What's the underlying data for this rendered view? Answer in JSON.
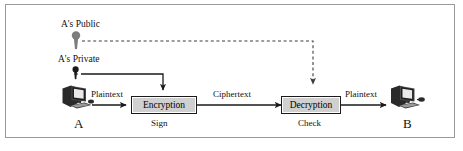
{
  "figure": {
    "frame_color": "#9a9a9a",
    "background": "#ffffff",
    "line_color": "#1a1a1a",
    "box_fill": "#d0d0d0",
    "public_key_color": "#7d7d7d",
    "private_key_color": "#1a1a1a"
  },
  "keys": {
    "public": {
      "label": "A's Public",
      "icon": "key-icon"
    },
    "private": {
      "label": "A's Private",
      "icon": "key-icon"
    }
  },
  "nodes": {
    "sender": {
      "label": "A",
      "icon": "computer-icon"
    },
    "receiver": {
      "label": "B",
      "icon": "computer-icon"
    }
  },
  "processes": [
    {
      "label": "Encryption",
      "sublabel": "Sign"
    },
    {
      "label": "Decryption",
      "sublabel": "Check"
    }
  ],
  "flows": {
    "plaintext_in": "Plaintext",
    "ciphertext": "Ciphertext",
    "plaintext_out": "Plaintext"
  }
}
